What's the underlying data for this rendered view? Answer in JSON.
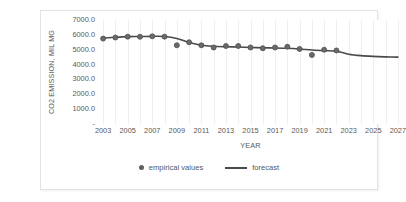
{
  "chart_data": {
    "type": "line",
    "title": "",
    "xlabel": "YEAR",
    "ylabel": "CO2 EMISSION, MIL MG",
    "ylim": [
      0,
      7000
    ],
    "xlim": [
      2002.5,
      2027.5
    ],
    "grid": "vertical",
    "legend_position": "bottom-center",
    "y_ticks": [
      "-",
      "1000.0",
      "2000.0",
      "3000.0",
      "4000.0",
      "5000.0",
      "6000.0",
      "7000.0"
    ],
    "y_tick_values": [
      0,
      1000,
      2000,
      3000,
      4000,
      5000,
      6000,
      7000
    ],
    "x_ticks": [
      "2003",
      "2005",
      "2007",
      "2009",
      "2011",
      "2013",
      "2015",
      "2017",
      "2019",
      "2021",
      "2023",
      "2025",
      "2027"
    ],
    "x_tick_values": [
      2003,
      2005,
      2007,
      2009,
      2011,
      2013,
      2015,
      2017,
      2019,
      2021,
      2023,
      2025,
      2027
    ],
    "series": [
      {
        "name": "empirical values",
        "style": "scatter",
        "color": "#5f5f5f",
        "x": [
          2003,
          2004,
          2005,
          2006,
          2007,
          2008,
          2009,
          2010,
          2011,
          2012,
          2013,
          2014,
          2015,
          2016,
          2017,
          2018,
          2019,
          2020,
          2021,
          2022
        ],
        "values": [
          5750,
          5820,
          5880,
          5870,
          5900,
          5880,
          5300,
          5500,
          5300,
          5150,
          5250,
          5250,
          5150,
          5100,
          5150,
          5200,
          5050,
          4650,
          5000,
          4950
        ]
      },
      {
        "name": "forecast",
        "style": "line",
        "color": "#4a4a4a",
        "x": [
          2003,
          2004,
          2005,
          2006,
          2007,
          2008,
          2009,
          2010,
          2011,
          2012,
          2013,
          2014,
          2015,
          2016,
          2017,
          2018,
          2019,
          2020,
          2021,
          2022,
          2023,
          2024,
          2025,
          2026,
          2027
        ],
        "values": [
          5780,
          5840,
          5880,
          5890,
          5900,
          5890,
          5760,
          5480,
          5300,
          5230,
          5200,
          5180,
          5150,
          5130,
          5120,
          5100,
          5050,
          4980,
          4940,
          4900,
          4700,
          4600,
          4550,
          4520,
          4500
        ]
      }
    ]
  },
  "legend": {
    "entries": [
      {
        "label": "empirical values",
        "marker": "dot-marker-icon"
      },
      {
        "label": "forecast",
        "marker": "line-marker-icon"
      }
    ]
  }
}
